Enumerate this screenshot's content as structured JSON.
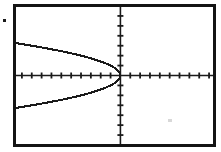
{
  "screen": {
    "device": "graphing-calculator-screen",
    "background_color": "#ffffff",
    "frame_color": "#141414",
    "ink_color": "#1a1a1a",
    "alt_text": "Graphing calculator screen showing a sideways parabola opening to the left with its vertex at the origin"
  },
  "artifacts": {
    "margin_speck_label": "",
    "print_smudge_label": ""
  },
  "chart_data": {
    "type": "line",
    "title": "",
    "subtitle": "",
    "xlabel": "",
    "ylabel": "",
    "grid": false,
    "legend": null,
    "axes": {
      "x_axis_visible": true,
      "y_axis_visible": true,
      "origin_screen_px": [
        107,
        69
      ],
      "xlim": [
        -10.6,
        9.4
      ],
      "ylim": [
        -6.9,
        6.9
      ],
      "x_tick_step": 1,
      "y_tick_step": 1,
      "x_tick_count": 19,
      "y_tick_count": 13,
      "tick_labels_visible": false,
      "x_tick_labels": [],
      "y_tick_labels": []
    },
    "equation": "x = -y^2",
    "series": [
      {
        "name": "x = -y^2 (upper branch)",
        "color": "#1a1a1a",
        "x": [
          -10.6,
          -9.5,
          -8.5,
          -7.5,
          -6.5,
          -5.5,
          -4.5,
          -3.6,
          -2.8,
          -2.0,
          -1.4,
          -0.9,
          -0.5,
          -0.22,
          -0.06,
          0.0
        ],
        "y": [
          3.26,
          3.08,
          2.92,
          2.74,
          2.55,
          2.35,
          2.12,
          1.9,
          1.67,
          1.41,
          1.18,
          0.95,
          0.71,
          0.47,
          0.24,
          0.0
        ]
      },
      {
        "name": "x = -y^2 (lower branch)",
        "color": "#1a1a1a",
        "x": [
          -10.6,
          -9.5,
          -8.5,
          -7.5,
          -6.5,
          -5.5,
          -4.5,
          -3.6,
          -2.8,
          -2.0,
          -1.4,
          -0.9,
          -0.5,
          -0.22,
          -0.06,
          0.0
        ],
        "y": [
          -3.26,
          -3.08,
          -2.92,
          -2.74,
          -2.55,
          -2.35,
          -2.12,
          -1.9,
          -1.67,
          -1.41,
          -1.18,
          -0.95,
          -0.71,
          -0.47,
          -0.24,
          0.0
        ]
      }
    ]
  }
}
